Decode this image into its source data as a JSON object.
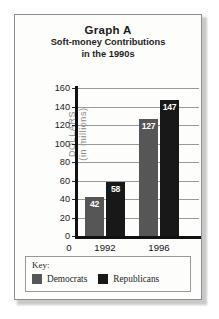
{
  "figure": {
    "title_main": "Graph A",
    "title_sub_line1": "Soft-money Contributions",
    "title_sub_line2": "in the 1990s"
  },
  "legend": {
    "key_label": "Key:",
    "items": [
      {
        "label": "Democrats",
        "color": "#565656"
      },
      {
        "label": "Republicans",
        "color": "#181818"
      }
    ]
  },
  "chart_data": {
    "type": "bar",
    "xlabel": "",
    "ylabel": "DOLLARS (in millions)",
    "ylabel_line1": "DOLLARS",
    "ylabel_line2": "(in millions)",
    "categories": [
      "1992",
      "1996"
    ],
    "x_origin_label": "0",
    "ylim": [
      0,
      160
    ],
    "yticks": [
      0,
      20,
      40,
      60,
      80,
      100,
      120,
      140,
      160
    ],
    "ytick_labels": [
      "0",
      "20",
      "40",
      "60",
      "80",
      "100",
      "120",
      "140",
      "160"
    ],
    "grid": true,
    "legend_position": "below",
    "series": [
      {
        "name": "Democrats",
        "color": "#565656",
        "values": [
          42,
          127
        ],
        "labels": [
          "42",
          "127"
        ]
      },
      {
        "name": "Republicans",
        "color": "#181818",
        "values": [
          58,
          147
        ],
        "labels": [
          "58",
          "147"
        ]
      }
    ]
  }
}
